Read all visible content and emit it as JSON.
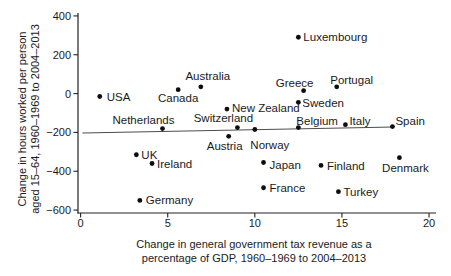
{
  "figure": {
    "background": "#ffffff",
    "colors": {
      "text": "#1a1a1a",
      "point": "#0d0d0d",
      "axis": "#222222",
      "trendline": "#4d4d4d"
    }
  },
  "chart_data": {
    "type": "scatter",
    "title": "",
    "xlabel": "Change in general government tax revenue as a percentage of GDP, 1960–1969 to 2004–2013",
    "xlabel_lines": [
      "Change in general government tax revenue as a",
      "percentage of GDP, 1960–1969 to 2004–2013"
    ],
    "ylabel": "Change in hours worked per person aged 15–64, 1960–1969 to 2004–2013",
    "ylabel_lines": [
      "Change in hours worked per person",
      "aged 15–64, 1960–1969 to 2004–2013"
    ],
    "xlim": [
      -0.15,
      20.4
    ],
    "ylim": [
      -615,
      415
    ],
    "xticks": {
      "values": [
        0,
        5,
        10,
        15,
        20
      ],
      "labels": [
        "0",
        "5",
        "10",
        "15",
        "20"
      ]
    },
    "yticks": {
      "values": [
        400,
        200,
        0,
        -200,
        -400,
        -600
      ],
      "labels": [
        "400",
        "200",
        "0",
        "−200",
        "−400",
        "−600"
      ]
    },
    "grid": false,
    "legend": false,
    "trendline": {
      "x1": 0.1,
      "y1": -203,
      "x2": 18.0,
      "y2": -172
    },
    "points": [
      {
        "country": "USA",
        "x": 1.1,
        "y": -15,
        "anchor": "start",
        "dx": 7,
        "dy": 5
      },
      {
        "country": "UK",
        "x": 3.2,
        "y": -315,
        "anchor": "start",
        "dx": 5,
        "dy": 4
      },
      {
        "country": "Germany",
        "x": 3.4,
        "y": -550,
        "anchor": "start",
        "dx": 6,
        "dy": 4
      },
      {
        "country": "Ireland",
        "x": 4.1,
        "y": -360,
        "anchor": "start",
        "dx": 5,
        "dy": 4.5
      },
      {
        "country": "Netherlands",
        "x": 4.7,
        "y": -180,
        "anchor": "middle",
        "dx": -19,
        "dy": -4.5
      },
      {
        "country": "Canada",
        "x": 5.6,
        "y": 20,
        "anchor": "middle",
        "dx": 0,
        "dy": 12
      },
      {
        "country": "Australia",
        "x": 6.9,
        "y": 35,
        "anchor": "middle",
        "dx": 7,
        "dy": -6.5
      },
      {
        "country": "New Zealand",
        "x": 8.4,
        "y": -80,
        "anchor": "start",
        "dx": 5,
        "dy": 3
      },
      {
        "country": "Austria",
        "x": 8.5,
        "y": -220,
        "anchor": "middle",
        "dx": -4,
        "dy": 14
      },
      {
        "country": "Switzerland",
        "x": 9.0,
        "y": -175,
        "anchor": "middle",
        "dx": -14,
        "dy": -5.5
      },
      {
        "country": "Norway",
        "x": 10.0,
        "y": -185,
        "anchor": "middle",
        "dx": 15,
        "dy": 19
      },
      {
        "country": "Japan",
        "x": 10.5,
        "y": -355,
        "anchor": "start",
        "dx": 6,
        "dy": 6.5
      },
      {
        "country": "France",
        "x": 10.5,
        "y": -485,
        "anchor": "start",
        "dx": 6,
        "dy": 4
      },
      {
        "country": "Belgium",
        "x": 12.5,
        "y": -175,
        "anchor": "start",
        "dx": -2,
        "dy": -3
      },
      {
        "country": "Sweden",
        "x": 12.5,
        "y": -45,
        "anchor": "start",
        "dx": 4,
        "dy": 4.5
      },
      {
        "country": "Luxembourg",
        "x": 12.5,
        "y": 290,
        "anchor": "start",
        "dx": 5,
        "dy": 4
      },
      {
        "country": "Greece",
        "x": 12.8,
        "y": 15,
        "anchor": "middle",
        "dx": -9,
        "dy": -3.5
      },
      {
        "country": "Finland",
        "x": 13.8,
        "y": -370,
        "anchor": "start",
        "dx": 6,
        "dy": 5
      },
      {
        "country": "Portugal",
        "x": 14.7,
        "y": 35,
        "anchor": "middle",
        "dx": 15,
        "dy": -3
      },
      {
        "country": "Turkey",
        "x": 14.8,
        "y": -505,
        "anchor": "start",
        "dx": 5,
        "dy": 4
      },
      {
        "country": "Italy",
        "x": 15.2,
        "y": -160,
        "anchor": "start",
        "dx": 4,
        "dy": 0
      },
      {
        "country": "Spain",
        "x": 17.9,
        "y": -170,
        "anchor": "start",
        "dx": 3,
        "dy": -2
      },
      {
        "country": "Denmark",
        "x": 18.3,
        "y": -330,
        "anchor": "middle",
        "dx": 6,
        "dy": 14
      }
    ]
  }
}
